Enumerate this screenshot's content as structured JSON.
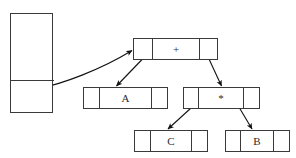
{
  "diagram": {
    "canvas": {
      "width": 296,
      "height": 158,
      "background": "#ffffff"
    },
    "stroke_color": "#3a3a3a",
    "text_color": "#2b2b2b",
    "stack": {
      "label": "",
      "top_cell_label": "",
      "bottom_cell_label": ""
    },
    "nodes": [
      {
        "id": "root",
        "value": "+",
        "left_ptr": "",
        "right_ptr": ""
      },
      {
        "id": "left-child",
        "value": "A",
        "left_ptr": "",
        "right_ptr": ""
      },
      {
        "id": "right-child",
        "value": "*",
        "left_ptr": "",
        "right_ptr": ""
      },
      {
        "id": "grandchild-left",
        "value": "C",
        "left_ptr": "",
        "right_ptr": ""
      },
      {
        "id": "grandchild-right",
        "value": "B",
        "left_ptr": "",
        "right_ptr": ""
      }
    ],
    "edges": [
      {
        "id": "stack-to-root",
        "from": "stack",
        "to": "root",
        "style": "curved-arrow"
      },
      {
        "id": "root-to-a",
        "from": "root",
        "to": "left-child",
        "style": "straight-arrow"
      },
      {
        "id": "root-to-star",
        "from": "root",
        "to": "right-child",
        "style": "straight-arrow"
      },
      {
        "id": "star-to-c",
        "from": "right-child",
        "to": "grandchild-left",
        "style": "straight-arrow"
      },
      {
        "id": "star-to-b",
        "from": "right-child",
        "to": "grandchild-right",
        "style": "straight-arrow"
      }
    ]
  }
}
